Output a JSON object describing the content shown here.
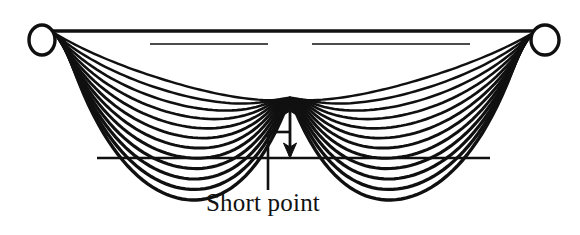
{
  "figure": {
    "background_color": "#ffffff",
    "stroke_color": "#101010",
    "width": 580,
    "height": 235
  },
  "annotation": {
    "label": "Short point",
    "label_x": 263,
    "label_y": 211,
    "leader": {
      "vertical_x": 268,
      "vertical_top_y": 132,
      "vertical_bottom_y": 190,
      "jog_to_x": 290,
      "jog_y": 132
    },
    "dimension_arrow": {
      "x": 290,
      "top_y": 100,
      "bottom_y": 158,
      "double_headed": true
    },
    "short_point": {
      "x": 290,
      "y": 100
    }
  },
  "geometry": {
    "left_anchor": {
      "cx": 42,
      "cy": 40,
      "rx": 13,
      "ry": 15
    },
    "right_anchor": {
      "cx": 545,
      "cy": 40,
      "rx": 14,
      "ry": 15
    },
    "top_rail_y": 31,
    "inner_rail_y": 44,
    "baseline": {
      "y": 158,
      "x1": 97,
      "x2": 490
    },
    "crossing_x": 290,
    "crossing_y": 100,
    "strand_count": 12,
    "left_loop": {
      "start_x": 52,
      "end_x": 290,
      "min_depth": 48,
      "max_depth": 157
    },
    "right_loop": {
      "start_x": 290,
      "end_x": 537,
      "min_depth": 48,
      "max_depth": 157
    }
  },
  "chart_data": {
    "type": "line",
    "xlabel": "",
    "ylabel": "",
    "annotations": [
      "Short point"
    ],
    "series": [
      {
        "name": "left-strand-1",
        "sag_depth": 48
      },
      {
        "name": "left-strand-2",
        "sag_depth": 58
      },
      {
        "name": "left-strand-3",
        "sag_depth": 68
      },
      {
        "name": "left-strand-4",
        "sag_depth": 78
      },
      {
        "name": "left-strand-5",
        "sag_depth": 88
      },
      {
        "name": "left-strand-6",
        "sag_depth": 98
      },
      {
        "name": "left-strand-7",
        "sag_depth": 108
      },
      {
        "name": "left-strand-8",
        "sag_depth": 118
      },
      {
        "name": "left-strand-9",
        "sag_depth": 128
      },
      {
        "name": "left-strand-10",
        "sag_depth": 138
      },
      {
        "name": "left-strand-11",
        "sag_depth": 148
      },
      {
        "name": "left-strand-12",
        "sag_depth": 157
      },
      {
        "name": "right-strand-1",
        "sag_depth": 48
      },
      {
        "name": "right-strand-2",
        "sag_depth": 58
      },
      {
        "name": "right-strand-3",
        "sag_depth": 68
      },
      {
        "name": "right-strand-4",
        "sag_depth": 78
      },
      {
        "name": "right-strand-5",
        "sag_depth": 88
      },
      {
        "name": "right-strand-6",
        "sag_depth": 98
      },
      {
        "name": "right-strand-7",
        "sag_depth": 108
      },
      {
        "name": "right-strand-8",
        "sag_depth": 118
      },
      {
        "name": "right-strand-9",
        "sag_depth": 128
      },
      {
        "name": "right-strand-10",
        "sag_depth": 138
      },
      {
        "name": "right-strand-11",
        "sag_depth": 148
      },
      {
        "name": "right-strand-12",
        "sag_depth": 157
      }
    ]
  }
}
